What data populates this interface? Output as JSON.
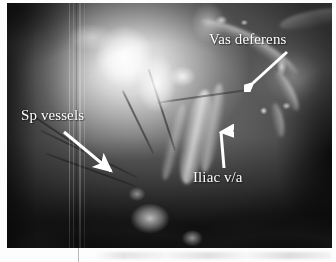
{
  "figure": {
    "kind": "laparoscopic-photograph",
    "modality": "endoscopic still image",
    "color_mode": "grayscale",
    "width_px": 336,
    "height_px": 262,
    "photo": {
      "left_px": 7,
      "top_px": 3,
      "width_px": 325,
      "height_px": 245
    },
    "background_color": "#ffffff",
    "annotation_color": "#ffffff"
  },
  "annotations": [
    {
      "id": "vas-deferens",
      "label": "Vas deferens",
      "label_position": {
        "left_px": 209,
        "top_px": 32
      },
      "arrow": {
        "from": {
          "x_px": 286,
          "y_px": 52
        },
        "to": {
          "x_px": 250,
          "y_px": 83
        },
        "direction": "down-left"
      }
    },
    {
      "id": "sp-vessels",
      "label": "Sp vessels",
      "label_position": {
        "left_px": 21,
        "top_px": 108
      },
      "arrow": {
        "from": {
          "x_px": 67,
          "y_px": 133
        },
        "to": {
          "x_px": 113,
          "y_px": 172
        },
        "direction": "down-right"
      }
    },
    {
      "id": "iliac-va",
      "label": "Iliac v/a",
      "label_position": {
        "left_px": 193,
        "top_px": 170
      },
      "arrow": {
        "from": {
          "x_px": 220,
          "y_px": 167
        },
        "to": {
          "x_px": 223,
          "y_px": 129
        },
        "direction": "up"
      }
    }
  ],
  "artifacts": {
    "scanlines": "vertical light streaks near left third of photo",
    "page_line": "faint vertical grey rule below photo",
    "page_smudge": "faint grey scanning smudge along bottom margin"
  }
}
